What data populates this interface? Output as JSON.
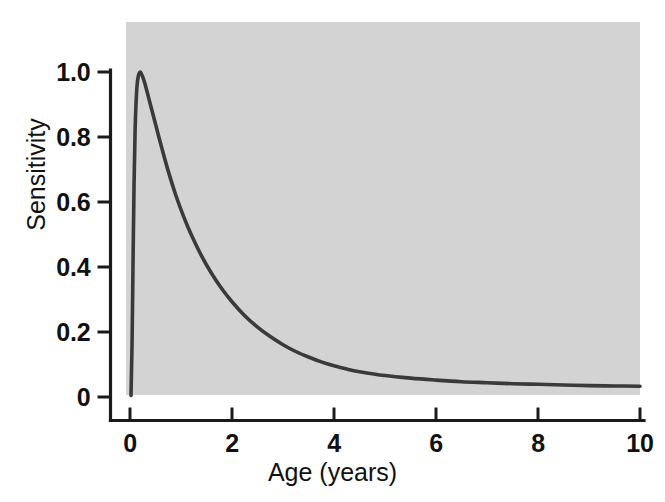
{
  "chart_data": {
    "type": "line",
    "title": "",
    "subtitle": "",
    "xlabel": "Age (years)",
    "ylabel": "Sensitivity",
    "xlim": [
      0,
      10
    ],
    "ylim": [
      0,
      1.0
    ],
    "xticks": [
      "0",
      "2",
      "4",
      "6",
      "8",
      "10"
    ],
    "xtick_values": [
      0,
      2,
      4,
      6,
      8,
      10
    ],
    "yticks": [
      "1.0",
      "0.8",
      "0.6",
      "0.4",
      "0.2",
      "0"
    ],
    "ytick_values": [
      1.0,
      0.8,
      0.6,
      0.4,
      0.2,
      0
    ],
    "grid": false,
    "legend": null,
    "legend_position": "none",
    "panel_background": "#d3d3d3",
    "curve_color": "#3a3a3a",
    "axis_color": "#1a1a1a",
    "series": [
      {
        "name": "Sensitivity",
        "x": [
          0.02,
          0.04,
          0.06,
          0.08,
          0.1,
          0.13,
          0.16,
          0.2,
          0.25,
          0.3,
          0.4,
          0.5,
          0.6,
          0.75,
          0.9,
          1.05,
          1.2,
          1.4,
          1.6,
          1.8,
          2.0,
          2.25,
          2.5,
          2.75,
          3.0,
          3.25,
          3.5,
          3.75,
          4.0,
          4.25,
          4.5,
          5.0,
          5.5,
          6.0,
          6.5,
          7.0,
          7.5,
          8.0,
          8.5,
          9.0,
          9.5,
          10.0
        ],
        "y": [
          0.005,
          0.16,
          0.42,
          0.66,
          0.82,
          0.94,
          0.985,
          1.0,
          0.985,
          0.96,
          0.9,
          0.84,
          0.78,
          0.695,
          0.62,
          0.556,
          0.5,
          0.435,
          0.38,
          0.333,
          0.293,
          0.25,
          0.215,
          0.186,
          0.161,
          0.14,
          0.123,
          0.108,
          0.096,
          0.086,
          0.078,
          0.066,
          0.058,
          0.052,
          0.047,
          0.044,
          0.041,
          0.039,
          0.037,
          0.035,
          0.034,
          0.033
        ]
      }
    ],
    "annotations": [
      {
        "text": "peak sensitivity",
        "x": 0.2,
        "y": 1.0
      }
    ]
  },
  "figure": {
    "xlabel": "Age (years)",
    "ylabel": "Sensitivity"
  }
}
